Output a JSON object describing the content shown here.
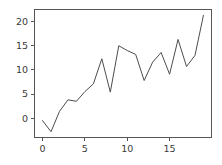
{
  "chart_data": {
    "type": "line",
    "title": "",
    "xlabel": "",
    "ylabel": "",
    "x": [
      0,
      1,
      2,
      3,
      4,
      5,
      6,
      7,
      8,
      9,
      10,
      11,
      12,
      13,
      14,
      15,
      16,
      17,
      18,
      19
    ],
    "values": [
      -0.5,
      -2.8,
      1.4,
      3.8,
      3.5,
      5.5,
      7.1,
      12.3,
      5.4,
      15.0,
      14.0,
      13.2,
      7.8,
      11.6,
      13.6,
      9.1,
      16.3,
      10.7,
      13.0,
      21.3
    ],
    "series": [
      {
        "name": "series-1",
        "color": "#4d4d4d",
        "values": [
          -0.5,
          -2.8,
          1.4,
          3.8,
          3.5,
          5.5,
          7.1,
          12.3,
          5.4,
          15.0,
          14.0,
          13.2,
          7.8,
          11.6,
          13.6,
          9.1,
          16.3,
          10.7,
          13.0,
          21.3
        ]
      }
    ],
    "xlim": [
      -0.95,
      19.95
    ],
    "ylim": [
      -4.0,
      22.5
    ],
    "xticks": [
      0,
      5,
      10,
      15
    ],
    "yticks": [
      0,
      5,
      10,
      15,
      20
    ],
    "xtick_labels": [
      "0",
      "5",
      "10",
      "15"
    ],
    "ytick_labels": [
      "0",
      "5",
      "10",
      "15",
      "20"
    ],
    "grid": false,
    "legend": false,
    "legend_position": "none",
    "background_color": "#ffffff",
    "axes_color": "#555555"
  }
}
